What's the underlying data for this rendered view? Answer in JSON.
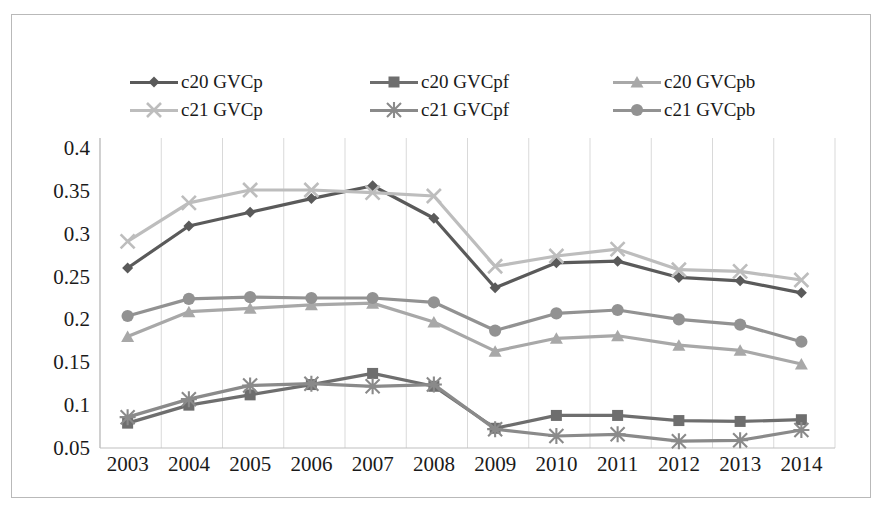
{
  "chart_data": {
    "type": "line",
    "title": "",
    "subtitle": "",
    "xlabel": "",
    "ylabel": "",
    "categories": [
      "2003",
      "2004",
      "2005",
      "2006",
      "2007",
      "2008",
      "2009",
      "2010",
      "2011",
      "2012",
      "2013",
      "2014"
    ],
    "x": [
      2003,
      2004,
      2005,
      2006,
      2007,
      2008,
      2009,
      2010,
      2011,
      2012,
      2013,
      2014
    ],
    "ylim": [
      0.05,
      0.4
    ],
    "yticks": [
      0.05,
      0.1,
      0.15,
      0.2,
      0.25,
      0.3,
      0.35,
      0.4
    ],
    "ytick_labels": [
      "0.05",
      "0.1",
      "0.15",
      "0.2",
      "0.25",
      "0.3",
      "0.35",
      "0.4"
    ],
    "grid": "vertical-gridlines-only",
    "legend_position": "top-inside",
    "series": [
      {
        "name": "c20 GVCp",
        "marker": "diamond",
        "color": "#5a5a5a",
        "values": [
          0.26,
          0.309,
          0.325,
          0.341,
          0.356,
          0.318,
          0.237,
          0.266,
          0.268,
          0.249,
          0.245,
          0.231
        ]
      },
      {
        "name": "c20 GVCpf",
        "marker": "square",
        "color": "#6e6e6e",
        "values": [
          0.079,
          0.1,
          0.112,
          0.124,
          0.137,
          0.122,
          0.073,
          0.088,
          0.088,
          0.082,
          0.081,
          0.083
        ]
      },
      {
        "name": "c20 GVCpb",
        "marker": "triangle",
        "color": "#a8a8a8",
        "values": [
          0.18,
          0.209,
          0.213,
          0.217,
          0.219,
          0.197,
          0.163,
          0.178,
          0.181,
          0.17,
          0.164,
          0.148
        ]
      },
      {
        "name": "c21 GVCp",
        "marker": "cross",
        "color": "#bdbdbd",
        "values": [
          0.291,
          0.336,
          0.351,
          0.351,
          0.348,
          0.344,
          0.262,
          0.274,
          0.282,
          0.258,
          0.256,
          0.246
        ]
      },
      {
        "name": "c21 GVCpf",
        "marker": "asterisk",
        "color": "#8a8a8a",
        "values": [
          0.086,
          0.107,
          0.123,
          0.125,
          0.122,
          0.124,
          0.072,
          0.064,
          0.066,
          0.058,
          0.059,
          0.071
        ]
      },
      {
        "name": "c21 GVCpb",
        "marker": "circle",
        "color": "#929292",
        "values": [
          0.204,
          0.224,
          0.226,
          0.225,
          0.225,
          0.22,
          0.187,
          0.207,
          0.211,
          0.2,
          0.194,
          0.174
        ]
      }
    ]
  },
  "legend": {
    "rows": [
      [
        {
          "label": "c20 GVCp",
          "series_index": 0
        },
        {
          "label": "c20 GVCpf",
          "series_index": 1
        },
        {
          "label": "c20 GVCpb",
          "series_index": 2
        }
      ],
      [
        {
          "label": "c21 GVCp",
          "series_index": 3
        },
        {
          "label": "c21 GVCpf",
          "series_index": 4
        },
        {
          "label": "c21 GVCpb",
          "series_index": 5
        }
      ]
    ]
  },
  "colors": {
    "frame_border": "#b9b9b9",
    "gridline": "#d9d9d9",
    "axis_line": "#bfbfbf",
    "text": "#1a1a1a",
    "background": "#ffffff"
  }
}
